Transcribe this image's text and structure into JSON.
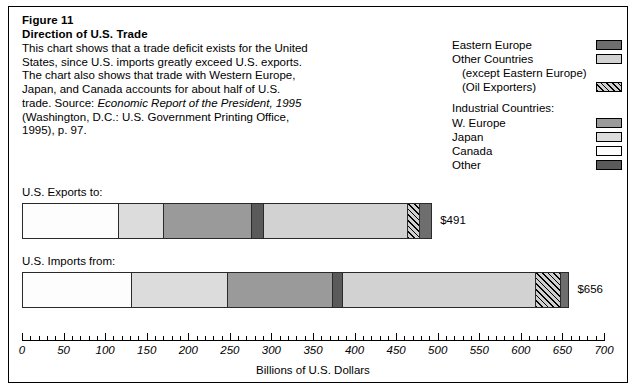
{
  "figure": {
    "number": "Figure 11",
    "title": "Direction of U.S. Trade",
    "body_line1": "This chart shows that a trade deficit exists for the United",
    "body_line2": "States, since U.S. imports greatly exceed U.S. exports.",
    "body_line3": "The chart also shows that trade with Western Europe,",
    "body_line4": "Japan, and Canada accounts for about half of U.S.",
    "body_line5_pre": "trade. Source: ",
    "body_line5_it": "Economic Report of the President, 1995",
    "body_line6": "(Washington, D.C.: U.S. Government Printing Office,",
    "body_line7": "1995), p. 97."
  },
  "legend": {
    "items": [
      {
        "label": "Eastern Europe",
        "swatch": "east",
        "indent": false
      },
      {
        "label": "Other Countries",
        "swatch": "other",
        "indent": false
      },
      {
        "label": "(except Eastern Europe)",
        "swatch": null,
        "indent": true
      },
      {
        "label": "(Oil Exporters)",
        "swatch": "oil",
        "indent": true
      }
    ],
    "group_heading": "Industrial Countries:",
    "group_items": [
      {
        "label": "W. Europe",
        "swatch": "weur"
      },
      {
        "label": "Japan",
        "swatch": "japan"
      },
      {
        "label": "Canada",
        "swatch": "canada"
      },
      {
        "label": "Other",
        "swatch": "oind"
      }
    ]
  },
  "colors": {
    "eastern_europe": "#6e6e6e",
    "other_countries": "#d2d2d2",
    "oil_exporters": "#cfcfcf",
    "w_europe": "#9a9a9a",
    "japan": "#dcdcdc",
    "canada": "#fdfdfd",
    "other_industrial": "#5a5a5a"
  },
  "chart_data": {
    "type": "bar",
    "orientation": "horizontal",
    "stacked": true,
    "title": "Direction of U.S. Trade",
    "xlabel": "Billions of U.S. Dollars",
    "ylabel": "",
    "xlim": [
      0,
      700
    ],
    "grid": false,
    "legend_position": "top-right",
    "major_tick_step": 50,
    "minor_tick_step": 10,
    "tick_labels": [
      "0",
      "50",
      "100",
      "150",
      "200",
      "250",
      "300",
      "350",
      "400",
      "450",
      "500",
      "550",
      "600",
      "650",
      "700"
    ],
    "categories": [
      "U.S. Exports to:",
      "U.S. Imports from:"
    ],
    "series": [
      {
        "name": "Canada",
        "key": "canada",
        "values": [
          115,
          131
        ]
      },
      {
        "name": "Japan",
        "key": "japan",
        "values": [
          55,
          116
        ]
      },
      {
        "name": "W. Europe",
        "key": "weur",
        "values": [
          105,
          126
        ]
      },
      {
        "name": "Other (Industrial)",
        "key": "oind",
        "values": [
          15,
          12
        ]
      },
      {
        "name": "Other Countries (except Eastern Europe)",
        "key": "other",
        "values": [
          173,
          232
        ]
      },
      {
        "name": "Oil Exporters",
        "key": "oil",
        "values": [
          15,
          30
        ]
      },
      {
        "name": "Eastern Europe",
        "key": "east",
        "values": [
          13,
          9
        ]
      }
    ],
    "totals": [
      491,
      656
    ],
    "total_labels": [
      "$491",
      "$656"
    ]
  },
  "axis": {
    "title": "Billions of U.S. Dollars"
  }
}
